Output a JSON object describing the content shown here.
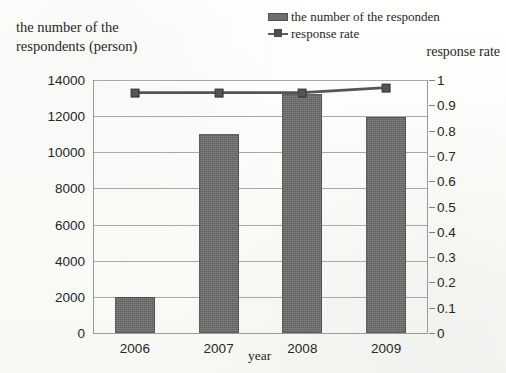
{
  "chart_data": {
    "type": "bar",
    "title": "",
    "subtitle": "",
    "categories": [
      "2006",
      "2007",
      "2008",
      "2009"
    ],
    "xlabel": "year",
    "ylabel": "the number of the respondents (person)",
    "ylabel_secondary": "response rate",
    "ylim": [
      0,
      14000
    ],
    "ylim_secondary": [
      0,
      1
    ],
    "yticks": [
      "14000",
      "12000",
      "10000",
      "8000",
      "6000",
      "4000",
      "2000",
      "0"
    ],
    "ytick_values": [
      14000,
      12000,
      10000,
      8000,
      6000,
      4000,
      2000,
      0
    ],
    "yticks_secondary": [
      "1",
      "0.9",
      "0.8",
      "0.7",
      "0.6",
      "0.5",
      "0.4",
      "0.3",
      "0.2",
      "0.1",
      "0"
    ],
    "ytick_values_secondary": [
      1,
      0.9,
      0.8,
      0.7,
      0.6,
      0.5,
      0.4,
      0.3,
      0.2,
      0.1,
      0
    ],
    "grid": true,
    "legend_position": "top-right",
    "series": [
      {
        "name": "the number of the responden",
        "type": "bar",
        "axis": "left",
        "color": "#6b6b6b",
        "values": [
          2000,
          11000,
          13200,
          11950
        ]
      },
      {
        "name": "response rate",
        "type": "line",
        "axis": "right",
        "color": "#555555",
        "values": [
          0.95,
          0.95,
          0.95,
          0.97
        ]
      }
    ]
  },
  "legend": {
    "items": [
      {
        "label": "the number of the responden",
        "marker": "bar-swatch"
      },
      {
        "label": "response rate",
        "marker": "line-marker-swatch"
      }
    ]
  },
  "axis_titles": {
    "left": "the number of the\nrespondents (person)",
    "right": "response rate",
    "x": "year"
  }
}
